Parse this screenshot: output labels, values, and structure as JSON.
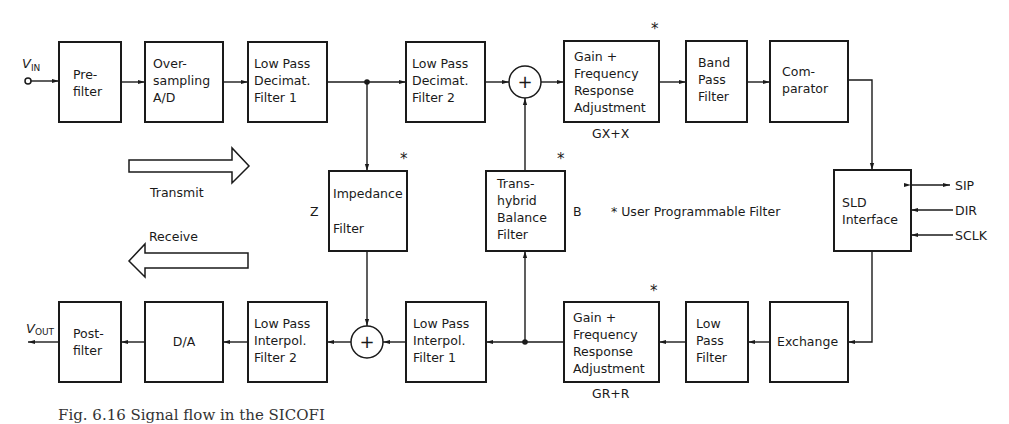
{
  "figure": {
    "caption": "Fig. 6.16   Signal flow in the SICOFI",
    "legend": "* User Programmable Filter",
    "star_symbol": "*"
  },
  "signals": {
    "input": {
      "main": "V",
      "sub": "IN"
    },
    "output": {
      "main": "V",
      "sub": "OUT"
    }
  },
  "direction_arrows": {
    "transmit": "Transmit",
    "receive": "Receive"
  },
  "transmit_path": {
    "prefilter": [
      "Pre-",
      "filter"
    ],
    "oversampling_ad": [
      "Over-",
      "sampling",
      "A/D"
    ],
    "lp_decimat_1": [
      "Low Pass",
      "Decimat.",
      "Filter 1"
    ],
    "lp_decimat_2": [
      "Low Pass",
      "Decimat.",
      "Filter 2"
    ],
    "sum_symbol": "+",
    "gain_freq_tx": [
      "Gain +",
      "Frequency",
      "Response",
      "Adjustment"
    ],
    "gain_freq_tx_label": "GX+X",
    "band_pass": [
      "Band",
      "Pass",
      "Filter"
    ],
    "comparator": [
      "Com-",
      "parator"
    ]
  },
  "middle": {
    "impedance_filter": [
      "Impedance",
      "Filter"
    ],
    "impedance_label": "Z",
    "transhybrid_filter": [
      "Trans-",
      "hybrid",
      "Balance",
      "Filter"
    ],
    "transhybrid_label": "B",
    "sld_interface": [
      "SLD",
      "Interface"
    ],
    "sld_pins": [
      "SIP",
      "DIR",
      "SCLK"
    ]
  },
  "receive_path": {
    "postfilter": [
      "Post-",
      "filter"
    ],
    "da": [
      "D/A"
    ],
    "lp_interpol_2": [
      "Low Pass",
      "Interpol.",
      "Filter 2"
    ],
    "sum_symbol": "+",
    "lp_interpol_1": [
      "Low Pass",
      "Interpol.",
      "Filter 1"
    ],
    "gain_freq_rx": [
      "Gain +",
      "Frequency",
      "Response",
      "Adjustment"
    ],
    "gain_freq_rx_label": "GR+R",
    "low_pass": [
      "Low",
      "Pass",
      "Filter"
    ],
    "exchange": [
      "Exchange"
    ]
  }
}
